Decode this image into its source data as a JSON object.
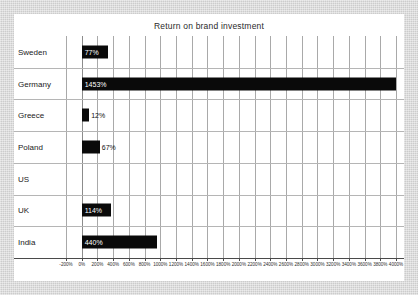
{
  "chart_data": {
    "type": "bar",
    "orientation": "horizontal",
    "title": "Return on brand investment",
    "xlabel": "",
    "ylabel": "",
    "categories": [
      "Sweden",
      "Germany",
      "Greece",
      "Poland",
      "US",
      "UK",
      "India"
    ],
    "values": [
      77,
      1453,
      12,
      67,
      null,
      114,
      440
    ],
    "data_labels": [
      "77%",
      "1453%",
      "12%",
      "67%",
      "",
      "114%",
      "440%"
    ],
    "bar_visual_extent_percent": [
      330,
      4000,
      95,
      230,
      0,
      375,
      960
    ],
    "label_placement": [
      "inside",
      "inside",
      "outside",
      "outside",
      "none",
      "inside",
      "inside"
    ],
    "xlim": [
      -200,
      4000
    ],
    "xtick_step": 200,
    "xticklabels": [
      "-200%",
      "0%",
      "200%",
      "400%",
      "600%",
      "800%",
      "1000%",
      "1200%",
      "1400%",
      "1600%",
      "1800%",
      "2000%",
      "2200%",
      "2400%",
      "2600%",
      "2800%",
      "3000%",
      "3200%",
      "3400%",
      "3600%",
      "3800%",
      "4000%"
    ],
    "grid": true,
    "legend": false,
    "series_color": "#0a0a0a",
    "gridline_color": "#a9a9a9",
    "panel_color": "#ffffff",
    "background_color": "#d4d4d4"
  }
}
